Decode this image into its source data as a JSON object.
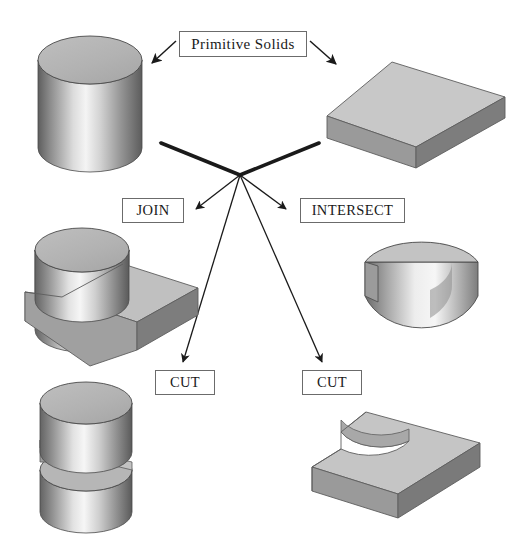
{
  "figure": {
    "title_label": "Primitive Solids",
    "background_color": "#ffffff",
    "width": 523,
    "height": 547,
    "topic": "Constructive Solid Geometry boolean operations"
  },
  "labels": {
    "primitive_solids": "Primitive Solids",
    "join": "JOIN",
    "intersect": "INTERSECT",
    "cut_left": "CUT",
    "cut_right": "CUT"
  },
  "palette": {
    "outline": "#3a3a3a",
    "box_outline": "#6b6b6b",
    "arrow": "#1a1a1a",
    "thick_connector": "#1a1a1a",
    "top_face_light": "#c8c8c8",
    "front_face_mid": "#8a8a8a",
    "side_face_dark": "#6e6e6e",
    "cylinder_top": "#b4b4b4",
    "cylinder_highlight": "#f2f2f2",
    "cylinder_shadow": "#5a5a5a",
    "text": "#1a1a1a"
  },
  "solids": [
    {
      "id": "primitive-cylinder",
      "name": "cylinder",
      "role": "primitive",
      "position": "top-left"
    },
    {
      "id": "primitive-box",
      "name": "rectangular box",
      "role": "primitive",
      "position": "top-right"
    },
    {
      "id": "result-join",
      "name": "cylinder united with box",
      "role": "result",
      "operation": "JOIN",
      "position": "middle-left"
    },
    {
      "id": "result-intersect",
      "name": "half cylinder wedge",
      "role": "result",
      "operation": "INTERSECT",
      "position": "middle-right"
    },
    {
      "id": "result-cut-cylinder",
      "name": "cylinder with slot removed",
      "role": "result",
      "operation": "CUT",
      "position": "bottom-left"
    },
    {
      "id": "result-cut-box",
      "name": "box with circular notch removed",
      "role": "result",
      "operation": "CUT",
      "position": "bottom-right"
    }
  ],
  "connectors": [
    {
      "id": "arrow-primitive-to-cylinder",
      "from": "Primitive Solids",
      "to": "cylinder",
      "style": "thin-arrow"
    },
    {
      "id": "arrow-primitive-to-box",
      "from": "Primitive Solids",
      "to": "rectangular box",
      "style": "thin-arrow"
    },
    {
      "id": "link-cylinder-to-hub",
      "from": "cylinder",
      "to": "operation hub",
      "style": "thick-line"
    },
    {
      "id": "link-box-to-hub",
      "from": "rectangular box",
      "to": "operation hub",
      "style": "thick-line"
    },
    {
      "id": "arrow-hub-to-join",
      "from": "operation hub",
      "to": "JOIN",
      "style": "thin-arrow"
    },
    {
      "id": "arrow-hub-to-intersect",
      "from": "operation hub",
      "to": "INTERSECT",
      "style": "thin-arrow"
    },
    {
      "id": "arrow-hub-to-cut-left",
      "from": "operation hub",
      "to": "CUT",
      "style": "thin-arrow"
    },
    {
      "id": "arrow-hub-to-cut-right",
      "from": "operation hub",
      "to": "CUT",
      "style": "thin-arrow"
    }
  ]
}
